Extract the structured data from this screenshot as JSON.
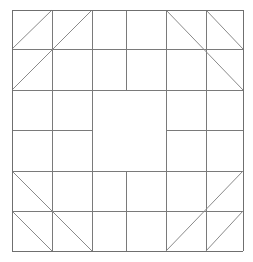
{
  "figure": {
    "type": "line-diagram",
    "background_color": "#ffffff",
    "line_color": "#7a7a7a",
    "diagonal_color": "#8a8a8a",
    "frame_color": "#6f6f6f",
    "canvas": {
      "width": 253,
      "height": 262
    }
  },
  "geometry": {
    "x_grid": [
      12,
      52,
      92,
      126,
      166,
      206,
      243
    ],
    "y_grid": [
      10,
      49,
      90,
      130,
      171,
      211,
      251
    ],
    "outer_frame": {
      "left": 12,
      "top": 10,
      "right": 243,
      "bottom": 251
    },
    "center_open_square": {
      "left": 92,
      "top": 90,
      "right": 166,
      "bottom": 171
    }
  },
  "lines": {
    "frame": [
      {
        "name": "frame-top",
        "x1": 12,
        "y1": 10,
        "x2": 243,
        "y2": 10
      },
      {
        "name": "frame-bottom",
        "x1": 12,
        "y1": 251,
        "x2": 243,
        "y2": 251
      },
      {
        "name": "frame-left",
        "x1": 12,
        "y1": 10,
        "x2": 12,
        "y2": 251
      },
      {
        "name": "frame-right",
        "x1": 243,
        "y1": 10,
        "x2": 243,
        "y2": 251
      }
    ],
    "horizontal": [
      {
        "name": "h-row1-full",
        "x1": 12,
        "y1": 49,
        "x2": 243,
        "y2": 49
      },
      {
        "name": "h-row2-full",
        "x1": 12,
        "y1": 90,
        "x2": 243,
        "y2": 90
      },
      {
        "name": "h-row3-left-stub",
        "x1": 12,
        "y1": 130,
        "x2": 92,
        "y2": 130
      },
      {
        "name": "h-row3-right-stub",
        "x1": 166,
        "y1": 130,
        "x2": 243,
        "y2": 130
      },
      {
        "name": "h-row4-full",
        "x1": 12,
        "y1": 171,
        "x2": 243,
        "y2": 171
      },
      {
        "name": "h-row5-full",
        "x1": 12,
        "y1": 211,
        "x2": 243,
        "y2": 211
      }
    ],
    "vertical": [
      {
        "name": "v-col1-full",
        "x1": 52,
        "y1": 10,
        "x2": 52,
        "y2": 251
      },
      {
        "name": "v-col2-full",
        "x1": 92,
        "y1": 10,
        "x2": 92,
        "y2": 251
      },
      {
        "name": "v-center-top-stub",
        "x1": 126,
        "y1": 10,
        "x2": 126,
        "y2": 90
      },
      {
        "name": "v-center-bot-stub",
        "x1": 126,
        "y1": 171,
        "x2": 126,
        "y2": 251
      },
      {
        "name": "v-col4-full",
        "x1": 166,
        "y1": 10,
        "x2": 166,
        "y2": 251
      },
      {
        "name": "v-col5-full",
        "x1": 206,
        "y1": 10,
        "x2": 206,
        "y2": 251
      }
    ],
    "diagonals": [
      {
        "name": "diag-tl-short",
        "corner": "top-left",
        "x1": 12,
        "y1": 49,
        "x2": 52,
        "y2": 10
      },
      {
        "name": "diag-tl-long",
        "corner": "top-left",
        "x1": 12,
        "y1": 90,
        "x2": 92,
        "y2": 10
      },
      {
        "name": "diag-tr-long",
        "corner": "top-right",
        "x1": 166,
        "y1": 10,
        "x2": 243,
        "y2": 90
      },
      {
        "name": "diag-tr-short",
        "corner": "top-right",
        "x1": 206,
        "y1": 10,
        "x2": 243,
        "y2": 49
      },
      {
        "name": "diag-bl-long",
        "corner": "bottom-left",
        "x1": 12,
        "y1": 171,
        "x2": 92,
        "y2": 251
      },
      {
        "name": "diag-bl-short",
        "corner": "bottom-left",
        "x1": 12,
        "y1": 211,
        "x2": 52,
        "y2": 251
      },
      {
        "name": "diag-br-long",
        "corner": "bottom-right",
        "x1": 166,
        "y1": 251,
        "x2": 243,
        "y2": 171
      },
      {
        "name": "diag-br-short",
        "corner": "bottom-right",
        "x1": 206,
        "y1": 251,
        "x2": 243,
        "y2": 211
      }
    ]
  }
}
